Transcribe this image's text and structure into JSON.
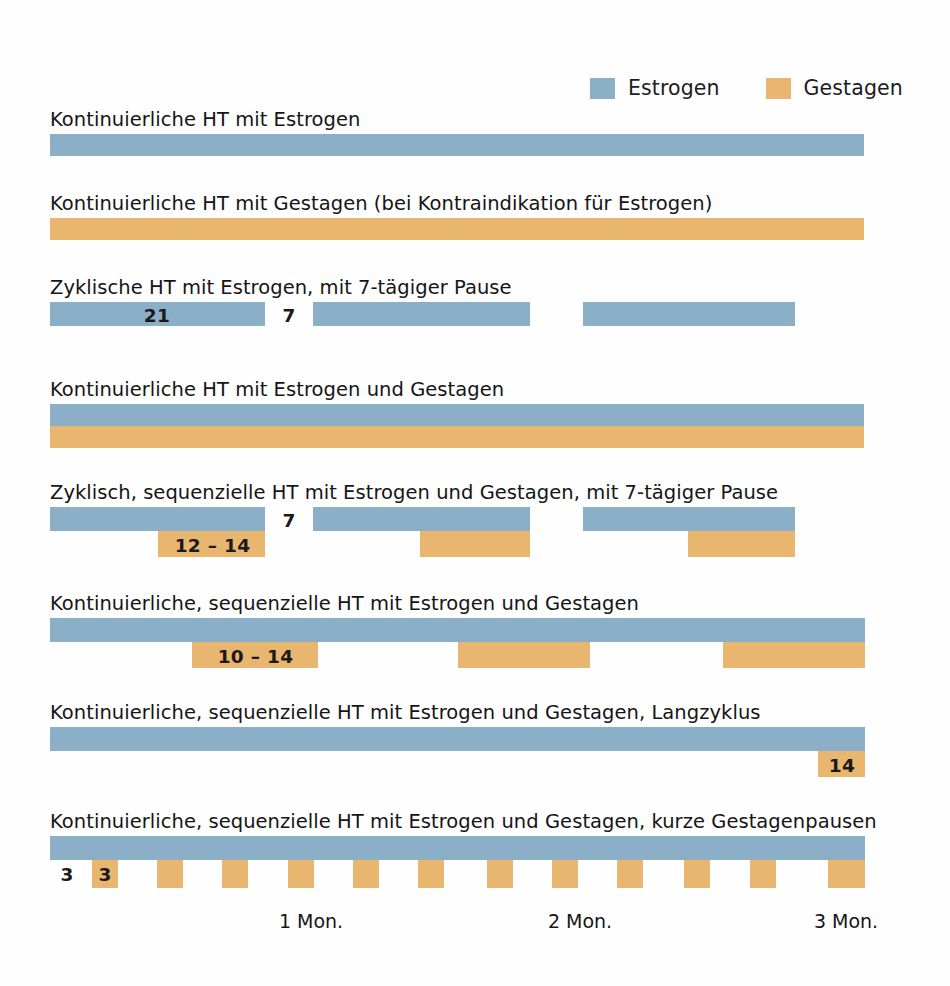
{
  "legend": {
    "entries": [
      {
        "label": "Estrogen",
        "color": "#8cafc8",
        "icon": "legend-swatch-estrogen"
      },
      {
        "label": "Gestagen",
        "color": "#e9b670",
        "icon": "legend-swatch-gestagen"
      }
    ]
  },
  "colors": {
    "estrogen": "#8cafc8",
    "gestagen": "#e9b670",
    "background": "#fefefe",
    "text": "#151515"
  },
  "axis": {
    "ticks": [
      {
        "label": "1 Mon.",
        "x": 311
      },
      {
        "label": "2 Mon.",
        "x": 580
      },
      {
        "label": "3 Mon.",
        "x": 846
      }
    ]
  },
  "rows": [
    {
      "id": "kontinuierliche-ht-mit-estrogen",
      "label": "Kontinuierliche HT mit Estrogen",
      "top": 108,
      "estrogen_segments": [
        {
          "x": 50,
          "w": 814,
          "y": 0,
          "h": 22
        }
      ],
      "gestagen_segments": [],
      "numbers": []
    },
    {
      "id": "kontinuierliche-ht-mit-gestagen",
      "label": "Kontinuierliche HT mit Gestagen (bei Kontraindikation für Estrogen)",
      "top": 192,
      "estrogen_segments": [],
      "gestagen_segments": [
        {
          "x": 50,
          "w": 814,
          "y": 0,
          "h": 22
        }
      ],
      "numbers": []
    },
    {
      "id": "zyklische-ht-mit-estrogen-7-tage-pause",
      "label": "Zyklische HT mit Estrogen, mit 7-tägiger Pause",
      "top": 276,
      "estrogen_segments": [
        {
          "x": 50,
          "w": 215,
          "y": 0,
          "h": 24
        },
        {
          "x": 313,
          "w": 217,
          "y": 0,
          "h": 24
        },
        {
          "x": 583,
          "w": 212,
          "y": 0,
          "h": 24
        }
      ],
      "gestagen_segments": [],
      "numbers": [
        {
          "text": "21",
          "x": 137,
          "y": 3,
          "w": 40,
          "kind": "on-bar"
        },
        {
          "text": "7",
          "x": 269,
          "y": 3,
          "w": 40,
          "kind": "gap"
        }
      ]
    },
    {
      "id": "kontinuierliche-ht-mit-estrogen-und-gestagen",
      "label": "Kontinuierliche HT mit Estrogen und Gestagen",
      "top": 378,
      "estrogen_segments": [
        {
          "x": 50,
          "w": 814,
          "y": 0,
          "h": 22
        }
      ],
      "gestagen_segments": [
        {
          "x": 50,
          "w": 814,
          "y": 22,
          "h": 22
        }
      ],
      "numbers": []
    },
    {
      "id": "zyklisch-sequenzielle-ht-7-tage-pause",
      "label": "Zyklisch, sequenzielle HT mit Estrogen und Gestagen, mit 7-tägiger Pause",
      "top": 481,
      "estrogen_segments": [
        {
          "x": 50,
          "w": 215,
          "y": 0,
          "h": 24
        },
        {
          "x": 313,
          "w": 217,
          "y": 0,
          "h": 24
        },
        {
          "x": 583,
          "w": 212,
          "y": 0,
          "h": 24
        }
      ],
      "gestagen_segments": [
        {
          "x": 158,
          "w": 107,
          "y": 24,
          "h": 26
        },
        {
          "x": 420,
          "w": 110,
          "y": 24,
          "h": 26
        },
        {
          "x": 688,
          "w": 107,
          "y": 24,
          "h": 26
        }
      ],
      "numbers": [
        {
          "text": "12 – 14",
          "x": 165,
          "y": 28,
          "w": 95,
          "kind": "on-bar"
        },
        {
          "text": "7",
          "x": 269,
          "y": 3,
          "w": 40,
          "kind": "gap"
        }
      ]
    },
    {
      "id": "kontinuierliche-sequenzielle-ht",
      "label": "Kontinuierliche, sequenzielle HT mit Estrogen und Gestagen",
      "top": 592,
      "estrogen_segments": [
        {
          "x": 50,
          "w": 815,
          "y": 0,
          "h": 24
        }
      ],
      "gestagen_segments": [
        {
          "x": 192,
          "w": 126,
          "y": 24,
          "h": 26
        },
        {
          "x": 458,
          "w": 132,
          "y": 24,
          "h": 26
        },
        {
          "x": 723,
          "w": 142,
          "y": 24,
          "h": 26
        }
      ],
      "numbers": [
        {
          "text": "10 – 14",
          "x": 208,
          "y": 28,
          "w": 95,
          "kind": "on-bar"
        }
      ]
    },
    {
      "id": "kontinuierliche-sequenzielle-ht-langzyklus",
      "label": "Kontinuierliche, sequenzielle HT mit Estrogen und Gestagen, Langzyklus",
      "top": 701,
      "estrogen_segments": [
        {
          "x": 50,
          "w": 815,
          "y": 0,
          "h": 24
        }
      ],
      "gestagen_segments": [
        {
          "x": 818,
          "w": 47,
          "y": 24,
          "h": 26
        }
      ],
      "numbers": [
        {
          "text": "14",
          "x": 821,
          "y": 28,
          "w": 42,
          "kind": "on-bar"
        }
      ]
    },
    {
      "id": "kontinuierliche-sequenzielle-ht-kurze-gestagenpausen",
      "label": "Kontinuierliche, sequenzielle HT mit Estrogen und Gestagen, kurze Gestagenpausen",
      "top": 810,
      "estrogen_segments": [
        {
          "x": 50,
          "w": 815,
          "y": 0,
          "h": 24
        }
      ],
      "gestagen_segments": [
        {
          "x": 92,
          "w": 26,
          "y": 24,
          "h": 28
        },
        {
          "x": 157,
          "w": 26,
          "y": 24,
          "h": 28
        },
        {
          "x": 222,
          "w": 26,
          "y": 24,
          "h": 28
        },
        {
          "x": 288,
          "w": 26,
          "y": 24,
          "h": 28
        },
        {
          "x": 353,
          "w": 26,
          "y": 24,
          "h": 28
        },
        {
          "x": 418,
          "w": 26,
          "y": 24,
          "h": 28
        },
        {
          "x": 487,
          "w": 26,
          "y": 24,
          "h": 28
        },
        {
          "x": 552,
          "w": 26,
          "y": 24,
          "h": 28
        },
        {
          "x": 617,
          "w": 26,
          "y": 24,
          "h": 28
        },
        {
          "x": 684,
          "w": 26,
          "y": 24,
          "h": 28
        },
        {
          "x": 750,
          "w": 26,
          "y": 24,
          "h": 28
        },
        {
          "x": 828,
          "w": 37,
          "y": 24,
          "h": 28
        }
      ],
      "numbers": [
        {
          "text": "3",
          "x": 51,
          "y": 28,
          "w": 32,
          "kind": "gap"
        },
        {
          "text": "3",
          "x": 91,
          "y": 28,
          "w": 28,
          "kind": "on-bar"
        }
      ]
    }
  ],
  "chart_data": {
    "type": "bar",
    "xlabel": "Zeit",
    "ylabel": "",
    "xlim": [
      0,
      3
    ],
    "x_tick_labels": [
      "1 Mon.",
      "2 Mon.",
      "3 Mon."
    ],
    "x_tick_values": [
      1,
      2,
      3
    ],
    "grid": false,
    "legend_position": "top-right",
    "legend_entries": [
      "Estrogen",
      "Gestagen"
    ],
    "units": "Monate (ca. 271 px pro Monat, Start bei 50 px, Ende bei 865 px)",
    "series": [
      {
        "name": "Estrogen",
        "color": "#8cafc8"
      },
      {
        "name": "Gestagen",
        "color": "#e9b670"
      }
    ],
    "categories": [
      "Kontinuierliche HT mit Estrogen",
      "Kontinuierliche HT mit Gestagen (bei Kontraindikation für Estrogen)",
      "Zyklische HT mit Estrogen, mit 7-tägiger Pause",
      "Kontinuierliche HT mit Estrogen und Gestagen",
      "Zyklisch, sequenzielle HT mit Estrogen und Gestagen, mit 7-tägiger Pause",
      "Kontinuierliche, sequenzielle HT mit Estrogen und Gestagen",
      "Kontinuierliche, sequenzielle HT mit Estrogen und Gestagen, Langzyklus",
      "Kontinuierliche, sequenzielle HT mit Estrogen und Gestagen, kurze Gestagenpausen"
    ],
    "regimens": [
      {
        "category": "Kontinuierliche HT mit Estrogen",
        "estrogen_intervals_months": [
          [
            0.0,
            3.0
          ]
        ],
        "gestagen_intervals_months": [],
        "annotations": []
      },
      {
        "category": "Kontinuierliche HT mit Gestagen (bei Kontraindikation für Estrogen)",
        "estrogen_intervals_months": [],
        "gestagen_intervals_months": [
          [
            0.0,
            3.0
          ]
        ],
        "annotations": []
      },
      {
        "category": "Zyklische HT mit Estrogen, mit 7-tägiger Pause",
        "estrogen_intervals_months": [
          [
            0.0,
            0.79
          ],
          [
            0.97,
            1.77
          ],
          [
            1.97,
            2.75
          ]
        ],
        "gestagen_intervals_months": [],
        "annotations": [
          "21",
          "7"
        ],
        "annotation_meaning": "21 Tage Estrogen, 7 Tage Pause"
      },
      {
        "category": "Kontinuierliche HT mit Estrogen und Gestagen",
        "estrogen_intervals_months": [
          [
            0.0,
            3.0
          ]
        ],
        "gestagen_intervals_months": [
          [
            0.0,
            3.0
          ]
        ],
        "annotations": []
      },
      {
        "category": "Zyklisch, sequenzielle HT mit Estrogen und Gestagen, mit 7-tägiger Pause",
        "estrogen_intervals_months": [
          [
            0.0,
            0.79
          ],
          [
            0.97,
            1.77
          ],
          [
            1.97,
            2.75
          ]
        ],
        "gestagen_intervals_months": [
          [
            0.4,
            0.79
          ],
          [
            1.36,
            1.77
          ],
          [
            2.35,
            2.75
          ]
        ],
        "annotations": [
          "12 – 14",
          "7"
        ],
        "annotation_meaning": "12–14 Tage Gestagen, 7 Tage Pause"
      },
      {
        "category": "Kontinuierliche, sequenzielle HT mit Estrogen und Gestagen",
        "estrogen_intervals_months": [
          [
            0.0,
            3.0
          ]
        ],
        "gestagen_intervals_months": [
          [
            0.52,
            0.99
          ],
          [
            1.5,
            1.99
          ],
          [
            2.48,
            3.0
          ]
        ],
        "annotations": [
          "10 – 14"
        ],
        "annotation_meaning": "10–14 Tage Gestagen pro Monat"
      },
      {
        "category": "Kontinuierliche, sequenzielle HT mit Estrogen und Gestagen, Langzyklus",
        "estrogen_intervals_months": [
          [
            0.0,
            3.0
          ]
        ],
        "gestagen_intervals_months": [
          [
            2.83,
            3.0
          ]
        ],
        "annotations": [
          "14"
        ],
        "annotation_meaning": "14 Tage Gestagen am Ende des Langzyklus"
      },
      {
        "category": "Kontinuierliche, sequenzielle HT mit Estrogen und Gestagen, kurze Gestagenpausen",
        "estrogen_intervals_months": [
          [
            0.0,
            3.0
          ]
        ],
        "gestagen_intervals_months": [
          [
            0.155,
            0.251
          ],
          [
            0.395,
            0.49
          ],
          [
            0.634,
            0.73
          ],
          "...",
          [
            2.87,
            3.0
          ]
        ],
        "gestagen_segment_count": 12,
        "annotations": [
          "3",
          "3"
        ],
        "annotation_meaning": "3 Tage Pause, 3 Tage Gestagen im Wechsel"
      }
    ]
  }
}
